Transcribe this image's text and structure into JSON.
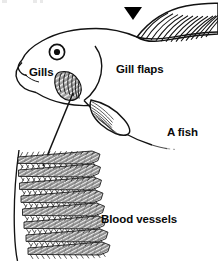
{
  "figure": {
    "name": "fish-gill-anatomy-diagram",
    "caption_labels": {
      "gills": "Gills",
      "gill_flaps": "Gill flaps",
      "a_fish": "A fish",
      "blood_vessels": "Blood vessels"
    },
    "colors": {
      "ink": "#111111",
      "paper": "#ffffff",
      "gill_fill": "#9a9a9a",
      "gill_stripe": "#f2f2f2",
      "filament_fill": "#8f8f8f",
      "filament_stripe": "#e8e8e8",
      "marker": "#000000",
      "faint_artifact": "#e9e9e9"
    },
    "parts": [
      {
        "name": "dorsal-fin",
        "description": "ray-lined fin along top right, cropped at image edge"
      },
      {
        "name": "fish-head-outline",
        "description": "head profile with snout and lower jaw at left"
      },
      {
        "name": "fish-eye",
        "description": "round eye with dark pupil and ring"
      },
      {
        "name": "operculum-line",
        "description": "curved gill cover boundary behind head"
      },
      {
        "name": "gill-arch-structure",
        "description": "grey fan of curved gill lamellae inside head"
      },
      {
        "name": "pectoral-fin",
        "description": "ray-lined fin below body midline"
      },
      {
        "name": "belly-outline",
        "description": "lower body curve fading toward the right"
      },
      {
        "name": "leader-line",
        "description": "straight pointer from gill structure to filament stack"
      },
      {
        "name": "gill-filament-stack",
        "description": "eight stacked shaded comb-toothed filaments at lower left"
      },
      {
        "name": "gill-arch-stem",
        "description": "long thin curve at far left supporting the filaments"
      },
      {
        "name": "triangle-marker",
        "description": "solid black downward-pointing triangle near top"
      }
    ],
    "marker": {
      "shape": "solid-down-triangle",
      "count": 1
    },
    "filaments": {
      "count": 8,
      "teeth_per_filament": 14
    }
  }
}
